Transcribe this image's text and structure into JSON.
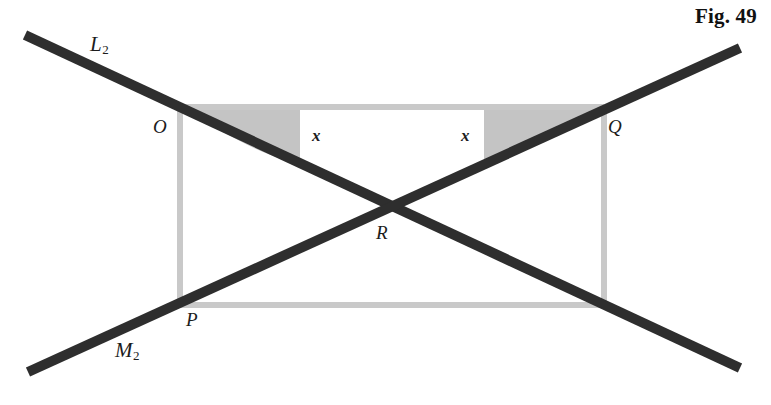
{
  "figure": {
    "caption": "Fig. 49",
    "background_color": "#ffffff",
    "line_color": "#2e2e2e",
    "rect_color": "#c9c9c9",
    "shade_color": "#c4c4c4",
    "text_color": "#1c1c1c",
    "width": 771,
    "height": 405
  },
  "lines": {
    "l2": {
      "label": "L",
      "subscript": "2",
      "from": [
        25,
        35
      ],
      "to": [
        740,
        368
      ],
      "thickness": 10
    },
    "m2": {
      "label": "M",
      "subscript": "2",
      "from": [
        28,
        372
      ],
      "to": [
        740,
        48
      ],
      "thickness": 10
    }
  },
  "points": [
    {
      "name": "O",
      "label": "O",
      "x": 180,
      "y": 107
    },
    {
      "name": "Q",
      "label": "Q",
      "x": 604,
      "y": 107
    },
    {
      "name": "R",
      "label": "R",
      "x": 385,
      "y": 205
    },
    {
      "name": "P",
      "label": "P",
      "x": 180,
      "y": 305
    }
  ],
  "rectangle": {
    "left": 180,
    "top": 107,
    "right": 604,
    "bottom": 305
  },
  "angles": [
    {
      "name": "angle-left",
      "label": "x",
      "vertex": [
        180,
        107
      ]
    },
    {
      "name": "angle-right",
      "label": "x",
      "vertex": [
        604,
        107
      ]
    }
  ]
}
